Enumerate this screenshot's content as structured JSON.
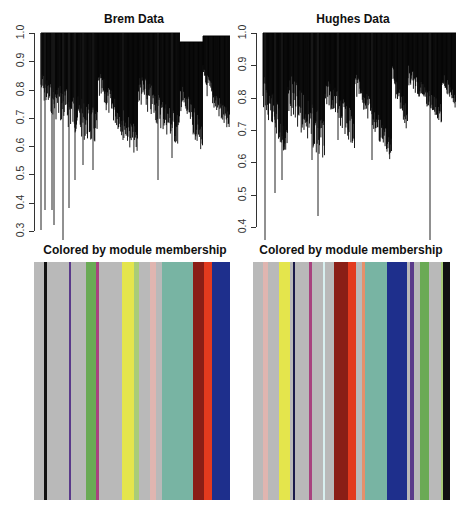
{
  "chart_data": [
    {
      "type": "dendrogram",
      "title": "Brem Data",
      "xlabel": "",
      "ylabel": "",
      "ylim": [
        0.3,
        1.0
      ],
      "yticks": [
        "0.3",
        "0.4",
        "0.5",
        "0.6",
        "0.7",
        "0.8",
        "0.9",
        "1.0"
      ],
      "grid": false,
      "module_bar": {
        "title": "Colored by module membership",
        "stripes": [
          {
            "color": "#b9b9b9",
            "w": 10
          },
          {
            "color": "#111111",
            "w": 3
          },
          {
            "color": "#b9b9b9",
            "w": 22
          },
          {
            "color": "#5a3a8a",
            "w": 2
          },
          {
            "color": "#b9b9b9",
            "w": 15
          },
          {
            "color": "#6aaa55",
            "w": 10
          },
          {
            "color": "#a8427e",
            "w": 3
          },
          {
            "color": "#b9b9b9",
            "w": 23
          },
          {
            "color": "#e4e54c",
            "w": 12
          },
          {
            "color": "#a8cc78",
            "w": 5
          },
          {
            "color": "#b9b9b9",
            "w": 11
          },
          {
            "color": "#e0b5b0",
            "w": 6
          },
          {
            "color": "#b9b9b9",
            "w": 6
          },
          {
            "color": "#78b4a3",
            "w": 31
          },
          {
            "color": "#8a1e16",
            "w": 11
          },
          {
            "color": "#e33a1e",
            "w": 8
          },
          {
            "color": "#1e2f8c",
            "w": 18
          }
        ]
      }
    },
    {
      "type": "dendrogram",
      "title": "Hughes Data",
      "xlabel": "",
      "ylabel": "",
      "ylim": [
        0.4,
        1.0
      ],
      "yticks": [
        "0.4",
        "0.5",
        "0.6",
        "0.7",
        "0.8",
        "0.9",
        "1.0"
      ],
      "grid": false,
      "module_bar": {
        "title": "Colored by module membership",
        "stripes": [
          {
            "color": "#b9b9b9",
            "w": 10
          },
          {
            "color": "#e0b5b0",
            "w": 5
          },
          {
            "color": "#b9b9b9",
            "w": 11
          },
          {
            "color": "#e4e54c",
            "w": 11
          },
          {
            "color": "#b9b9b9",
            "w": 3
          },
          {
            "color": "#1a1a4a",
            "w": 2
          },
          {
            "color": "#b9b9b9",
            "w": 14
          },
          {
            "color": "#a8427e",
            "w": 3
          },
          {
            "color": "#b9b9b9",
            "w": 11
          },
          {
            "color": "#d8f0f0",
            "w": 2
          },
          {
            "color": "#b9b9b9",
            "w": 9
          },
          {
            "color": "#8a1e16",
            "w": 14
          },
          {
            "color": "#e33a1e",
            "w": 8
          },
          {
            "color": "#b9b9b9",
            "w": 6
          },
          {
            "color": "#e6906a",
            "w": 3
          },
          {
            "color": "#78b4a3",
            "w": 22
          },
          {
            "color": "#1e2f8c",
            "w": 20
          },
          {
            "color": "#b9b9b9",
            "w": 3
          },
          {
            "color": "#5a3a8a",
            "w": 4
          },
          {
            "color": "#b9b9b9",
            "w": 6
          },
          {
            "color": "#6aaa55",
            "w": 9
          },
          {
            "color": "#b9b9b9",
            "w": 12
          },
          {
            "color": "#a8cc78",
            "w": 2
          },
          {
            "color": "#111111",
            "w": 7
          }
        ]
      }
    }
  ]
}
